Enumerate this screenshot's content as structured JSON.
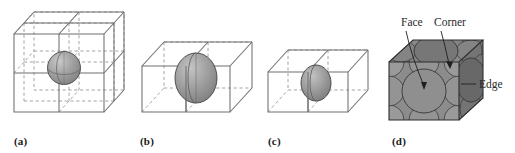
{
  "figure": {
    "width": 515,
    "height": 153,
    "background": "#ffffff",
    "line_color": "#6f6f6f",
    "hidden_line_color": "#9a9a9a",
    "sphere_fill": "#9a9a9a",
    "sphere_stroke": "#4a4a4a",
    "panel_d_face_top": "#7d7d7d",
    "panel_d_face_front": "#8c8c8c",
    "panel_d_face_right": "#6e6e6e",
    "panel_d_sphere_front": "#909090",
    "panel_d_sphere_top": "#777777",
    "panel_d_sphere_right": "#686868",
    "label_color": "#1a1a1a"
  },
  "panels": [
    {
      "id": "a",
      "label": "(a)",
      "label_x": 14,
      "description": "two-by-two-by-two block of unit cells with a sphere at the shared interior corner",
      "cells": 8,
      "sphere_position": "body-interior-corner",
      "sphere_fraction": "1/8 in each of 8 cells"
    },
    {
      "id": "b",
      "label": "(b)",
      "label_x": 140,
      "description": "two adjacent unit cells with a sphere centred on the shared face",
      "cells": 2,
      "sphere_position": "shared-face",
      "sphere_fraction": "1/2 in each of 2 cells"
    },
    {
      "id": "c",
      "label": "(c)",
      "label_x": 268,
      "description": "two adjacent unit cells with a smaller sphere centred on the shared face",
      "cells": 2,
      "sphere_position": "shared-face",
      "sphere_fraction": "1/2 in each of 2 cells"
    },
    {
      "id": "d",
      "label": "(d)",
      "label_x": 392,
      "description": "face-centred cubic unit cell packed with spheres showing face, corner and edge positions",
      "cells": 1,
      "sphere_position": "face-centred-cubic"
    }
  ],
  "callouts": [
    {
      "id": "face",
      "label": "Face",
      "x": 401,
      "y": 26,
      "anchor": "start"
    },
    {
      "id": "corner",
      "label": "Corner",
      "x": 434,
      "y": 26,
      "anchor": "start"
    },
    {
      "id": "edge",
      "label": "Edge",
      "x": 479,
      "y": 84,
      "anchor": "start"
    }
  ]
}
